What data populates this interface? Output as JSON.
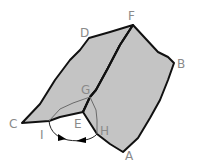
{
  "diagram": {
    "type": "folded-plane-dihedral-angle",
    "points": {
      "A": "A",
      "B": "B",
      "C": "C",
      "D": "D",
      "E": "E",
      "F": "F",
      "G": "G",
      "H": "H",
      "I": "I"
    },
    "faces": [
      "CDFE",
      "EFBA"
    ],
    "fold_edge": "EF",
    "angle_lines": [
      "GI",
      "GH"
    ],
    "angle_indicator": "double-arrow arc between I and H",
    "colors": {
      "face_fill": "#c4c4c4",
      "edge": "#111111",
      "label": "#8a8a8a"
    }
  }
}
